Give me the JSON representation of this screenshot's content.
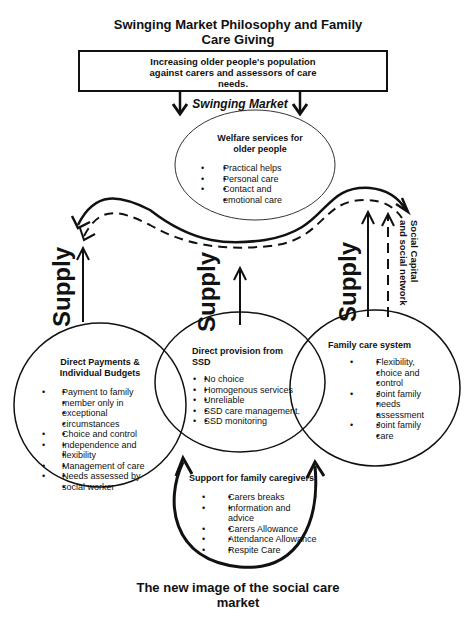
{
  "diagram": {
    "title": "Swinging Market Philosophy and Family Care Giving",
    "title_line1": "Swinging Market Philosophy and Family",
    "title_line2": "Care Giving",
    "top_box": {
      "line1": "Increasing older people's population",
      "line2": "against carers and assessors of care",
      "line3": "needs."
    },
    "swinging_market_label": "Swinging Market",
    "welfare": {
      "title_line1": "Welfare services for",
      "title_line2": "older people",
      "items": [
        "Practical helps",
        "Personal care",
        "Contact and",
        "emotional care"
      ]
    },
    "supply_labels": [
      "Supply",
      "Supply",
      "Supply"
    ],
    "social_capital": {
      "line1": "Social Capital",
      "line2": "and social network"
    },
    "direct_payments": {
      "title_line1": "Direct Payments &",
      "title_line2": "Individual Budgets",
      "items": [
        "Payment to family member only in exceptional circumstances",
        "Choice and control",
        "Independence and flexibility",
        "Management of care",
        "Needs assessed by social worker"
      ],
      "lines": [
        "Payment to family",
        "member only in",
        "exceptional",
        "circumstances",
        "Choice and control",
        "Independence and",
        "flexibility",
        "Management of care",
        "Needs assessed by",
        "social worker"
      ]
    },
    "direct_provision": {
      "title": "Direct provision from SSD",
      "items": [
        "No choice",
        "Homogenous services",
        "Unreliable",
        "SSD care management.",
        "SSD monitoring"
      ]
    },
    "family_care": {
      "title": "Family care system",
      "items": [
        "Flexibility, choice and control",
        "Joint family needs assessment",
        "Joint family care"
      ],
      "lines": [
        "Flexibility,",
        "choice and",
        "control",
        "Joint family",
        "needs",
        "assessment",
        "Joint family",
        "care"
      ]
    },
    "support": {
      "title": "Support for family caregivers",
      "items": [
        "Carers breaks",
        "Information and advice",
        "Carers Allowance",
        "Attendance Allowance",
        "Respite Care"
      ]
    },
    "bottom_title_line1": "The new image of the social care",
    "bottom_title_line2": "market",
    "colors": {
      "ink": "#111111",
      "background": "#ffffff"
    }
  }
}
